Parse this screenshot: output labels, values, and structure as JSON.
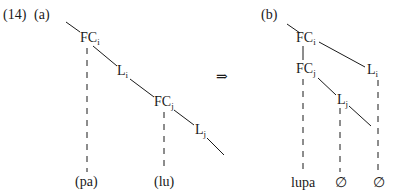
{
  "example_number": "(14)",
  "panels": {
    "a": {
      "label": "(a)",
      "nodes": {
        "fci": {
          "base": "FC",
          "sub": "i"
        },
        "li": {
          "base": "L",
          "sub": "i"
        },
        "fcj": {
          "base": "FC",
          "sub": "j"
        },
        "lj": {
          "base": "L",
          "sub": "j"
        }
      },
      "leaves": {
        "pa": "(pa)",
        "lu": "(lu)"
      }
    },
    "arrow": "⇒",
    "b": {
      "label": "(b)",
      "nodes": {
        "fci": {
          "base": "FC",
          "sub": "i"
        },
        "fcj": {
          "base": "FC",
          "sub": "j"
        },
        "li": {
          "base": "L",
          "sub": "i"
        },
        "lj": {
          "base": "L",
          "sub": "j"
        }
      },
      "leaves": {
        "lupa": "lupa",
        "empty1": "∅",
        "empty2": "∅"
      }
    }
  },
  "colors": {
    "ink": "#1a1a1a",
    "background": "#ffffff"
  }
}
